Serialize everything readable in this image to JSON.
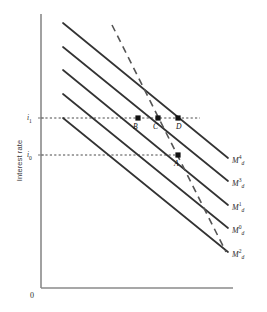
{
  "figure": {
    "background": "#ffffff",
    "axis_color": "#8a8a8a",
    "curve_color": "#333333",
    "dashed_color": "#555555",
    "marker_color": "#111111",
    "guide_color": "#4a4a4a"
  },
  "axes": {
    "y_title": "Interest rate",
    "origin_label": "0",
    "y_ticks": [
      {
        "name": "i-one",
        "text": "i",
        "subscript": "1",
        "y": 118
      },
      {
        "name": "i-zero",
        "text": "i",
        "subscript": "0",
        "y": 155
      }
    ]
  },
  "chart_data": {
    "type": "line",
    "title": "",
    "xlabel": "",
    "ylabel": "Interest rate",
    "grid": false,
    "legend_position": "right-of-curve-ends",
    "axis_x": {
      "from": [
        41,
        288
      ],
      "to": [
        233,
        288
      ]
    },
    "axis_y": {
      "from": [
        41,
        14
      ],
      "to": [
        41,
        288
      ]
    },
    "curves": [
      {
        "name": "md4",
        "label": "M",
        "sub": "d",
        "sup": "4",
        "style": "solid",
        "x1": 63,
        "y1": 23,
        "x2": 228,
        "y2": 158,
        "label_x": 232,
        "label_y": 162
      },
      {
        "name": "md3",
        "label": "M",
        "sub": "d",
        "sup": "3",
        "style": "solid",
        "x1": 63,
        "y1": 47,
        "x2": 228,
        "y2": 181,
        "label_x": 232,
        "label_y": 185
      },
      {
        "name": "md1",
        "label": "M",
        "sub": "d",
        "sup": "1",
        "style": "solid",
        "x1": 63,
        "y1": 70,
        "x2": 228,
        "y2": 205,
        "label_x": 232,
        "label_y": 209
      },
      {
        "name": "md0",
        "label": "M",
        "sub": "d",
        "sup": "0",
        "style": "solid",
        "x1": 63,
        "y1": 94,
        "x2": 228,
        "y2": 228,
        "label_x": 232,
        "label_y": 232
      },
      {
        "name": "md2",
        "label": "M",
        "sub": "d",
        "sup": "2",
        "style": "solid",
        "x1": 63,
        "y1": 118,
        "x2": 228,
        "y2": 252,
        "label_x": 232,
        "label_y": 256
      }
    ],
    "dashed_curve": {
      "name": "steep-money-demand",
      "style": "dashed",
      "x1": 112,
      "y1": 25,
      "x2": 226,
      "y2": 252
    },
    "guides": [
      {
        "name": "i1-guide",
        "y": 118,
        "x_from": 41,
        "x_to": 200
      },
      {
        "name": "i0-guide",
        "y": 155,
        "x_from": 41,
        "x_to": 180
      }
    ],
    "points": [
      {
        "name": "point-b",
        "label": "B",
        "x": 138,
        "y": 118,
        "label_x": 133,
        "label_y": 122
      },
      {
        "name": "point-c",
        "label": "C",
        "x": 158,
        "y": 118,
        "label_x": 153,
        "label_y": 122
      },
      {
        "name": "point-d",
        "label": "D",
        "x": 178,
        "y": 118,
        "label_x": 176,
        "label_y": 122
      },
      {
        "name": "point-a",
        "label": "A",
        "x": 178,
        "y": 155,
        "label_x": 174,
        "label_y": 159
      }
    ]
  }
}
